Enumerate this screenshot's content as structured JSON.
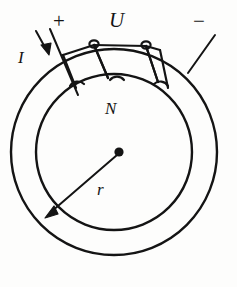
{
  "figure": {
    "stroke_color": "#141414",
    "background_color": "#fdfdfc",
    "labels": {
      "plus": "+",
      "voltage": "U",
      "minus": "−",
      "current": "I",
      "turns": "N",
      "radius": "r"
    },
    "geometry": {
      "center_x": 114,
      "center_y": 152,
      "outer_radius": 103,
      "inner_radius": 78,
      "winding_turns": 3
    }
  }
}
